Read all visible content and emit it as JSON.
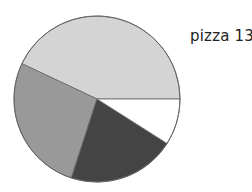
{
  "chart_data": {
    "type": "pie",
    "title": "pizza 13",
    "categories": [
      "slice 1",
      "slice 2",
      "slice 3",
      "slice 4"
    ],
    "values": [
      43,
      27,
      21,
      9
    ],
    "colors": [
      "#d4d4d4",
      "#999999",
      "#444444",
      "#ffffff"
    ],
    "start_angle_deg": 0,
    "direction": "counterclockwise",
    "stroke_color": "#666666",
    "legend": "none",
    "center": [
      97,
      99
    ],
    "radius": 83
  }
}
